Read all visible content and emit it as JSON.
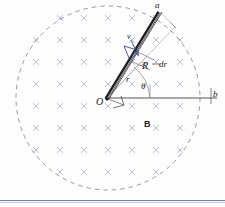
{
  "figure": {
    "colors": {
      "field_cross": "#8f9ccd",
      "circle_dashed": "#8a8a8a",
      "rod": "#1a1a1a",
      "velocity_arrow": "#3b4a8c",
      "slide_border": "#6b7fb5"
    },
    "field_region": {
      "shape": "circle",
      "center_x": 108,
      "center_y": 98,
      "radius": 92,
      "stroke_dash": "4 4",
      "label": "B",
      "field_direction": "into-page"
    },
    "field_marks": {
      "glyph": "x",
      "rows": 9,
      "cols": 9,
      "spacing_x": 24,
      "spacing_y": 22,
      "origin_x": 12,
      "origin_y": 18
    },
    "rod": {
      "from": "O",
      "to": "a",
      "x1": 106,
      "y1": 98,
      "x2": 160,
      "y2": 12,
      "width_px": 4
    },
    "axis_line": {
      "from": "O",
      "to": "b",
      "x1": 106,
      "y1": 98,
      "x2": 216,
      "y2": 98
    },
    "segment_guides": {
      "inner_x": 143,
      "inner_y": 80,
      "outer_x": 168,
      "outer_y": 30,
      "tick_top_x": 172,
      "tick_top_y": 26
    },
    "labels": {
      "a": "a",
      "b": "b",
      "O": "O",
      "r": "r",
      "R": "R",
      "dr": "dr",
      "theta": "θ",
      "v": "v",
      "B": "B"
    },
    "annotations": {
      "right_angle_marker": "square",
      "angle_arc_label": "θ",
      "velocity_vector_label": "v"
    }
  }
}
